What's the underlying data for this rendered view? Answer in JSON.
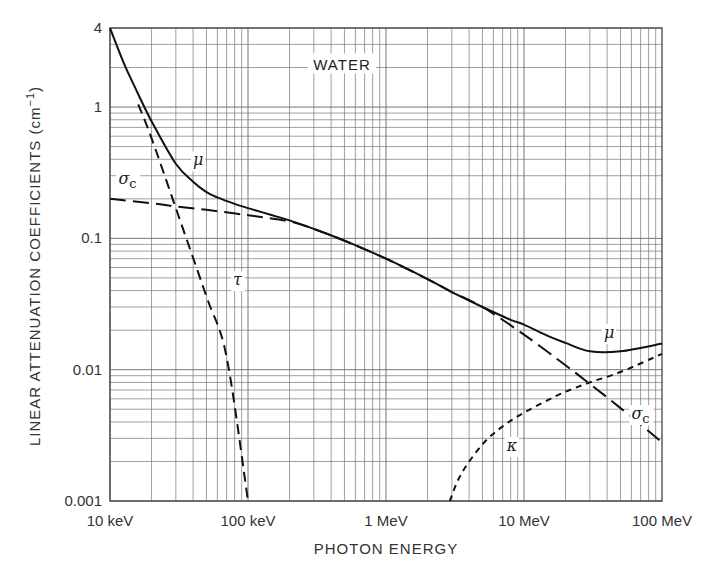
{
  "chart_data": {
    "type": "line",
    "title": "WATER",
    "xlabel": "PHOTON ENERGY",
    "ylabel": "LINEAR ATTENUATION COEFFICIENTS (cm⁻¹)",
    "xscale": "log",
    "yscale": "log",
    "xlim_MeV": [
      0.01,
      100
    ],
    "ylim": [
      0.001,
      4
    ],
    "grid": true,
    "legend": "inline curve labels",
    "x_ticks": [
      {
        "value": 0.01,
        "label": "10 keV"
      },
      {
        "value": 0.1,
        "label": "100 keV"
      },
      {
        "value": 1,
        "label": "1 MeV"
      },
      {
        "value": 10,
        "label": "10 MeV"
      },
      {
        "value": 100,
        "label": "100 MeV"
      }
    ],
    "y_ticks": [
      {
        "value": 4,
        "label": "4"
      },
      {
        "value": 1,
        "label": "1"
      },
      {
        "value": 0.1,
        "label": "0.1"
      },
      {
        "value": 0.01,
        "label": "0.01"
      },
      {
        "value": 0.001,
        "label": "0.001"
      }
    ],
    "series": [
      {
        "name": "μ",
        "description": "total linear attenuation coefficient",
        "style": "solid",
        "x_MeV": [
          0.01,
          0.0125,
          0.015,
          0.02,
          0.03,
          0.04,
          0.05,
          0.06,
          0.08,
          0.1,
          0.15,
          0.2,
          0.3,
          0.5,
          1,
          2,
          3,
          5,
          8,
          10,
          15,
          20,
          30,
          50,
          100
        ],
        "values": [
          4.0,
          2.2,
          1.45,
          0.78,
          0.37,
          0.27,
          0.225,
          0.205,
          0.183,
          0.17,
          0.15,
          0.137,
          0.118,
          0.096,
          0.07,
          0.049,
          0.039,
          0.03,
          0.024,
          0.022,
          0.018,
          0.016,
          0.0138,
          0.0138,
          0.0158
        ]
      },
      {
        "name": "σc",
        "description": "Compton scattering coefficient",
        "style": "long-dash",
        "x_MeV": [
          0.01,
          0.02,
          0.03,
          0.05,
          0.1,
          0.2,
          0.3,
          0.5,
          1,
          2,
          3,
          5,
          10,
          20,
          30,
          50,
          100
        ],
        "values": [
          0.2,
          0.185,
          0.175,
          0.165,
          0.15,
          0.135,
          0.118,
          0.096,
          0.07,
          0.049,
          0.039,
          0.03,
          0.0185,
          0.0108,
          0.0078,
          0.0051,
          0.0028
        ]
      },
      {
        "name": "τ",
        "description": "photoelectric absorption coefficient",
        "style": "dash",
        "x_MeV": [
          0.016,
          0.02,
          0.03,
          0.05,
          0.07,
          0.1
        ],
        "values": [
          1.05,
          0.58,
          0.17,
          0.036,
          0.0125,
          0.001
        ]
      },
      {
        "name": "κ",
        "description": "pair production coefficient",
        "style": "short-dash",
        "x_MeV": [
          2.9,
          3.5,
          5,
          7,
          10,
          15,
          20,
          30,
          50,
          100
        ],
        "values": [
          0.001,
          0.0016,
          0.0027,
          0.0037,
          0.0047,
          0.0059,
          0.0068,
          0.008,
          0.0096,
          0.0132
        ]
      }
    ],
    "annotations": [
      {
        "text": "WATER",
        "x_MeV": 0.1,
        "y": 2.0
      },
      {
        "text": "μ",
        "x_MeV": 0.04,
        "y": 0.36
      },
      {
        "text": "σc",
        "x_MeV": 0.0115,
        "y": 0.26
      },
      {
        "text": "τ",
        "x_MeV": 0.078,
        "y": 0.044
      },
      {
        "text": "μ",
        "x_MeV": 38,
        "y": 0.0175
      },
      {
        "text": "σc",
        "x_MeV": 60,
        "y": 0.0042
      },
      {
        "text": "κ",
        "x_MeV": 7.5,
        "y": 0.0024
      }
    ]
  },
  "labels": {
    "title": "WATER",
    "xlabel": "PHOTON ENERGY",
    "ylabel_main": "LINEAR ATTENUATION COEFFICIENTS (cm",
    "ylabel_sup": "−1",
    "ylabel_end": ")"
  }
}
